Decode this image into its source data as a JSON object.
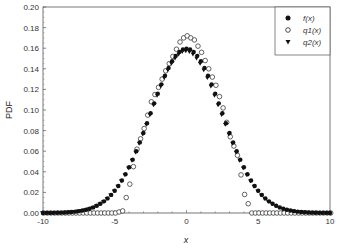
{
  "chart_data": {
    "type": "scatter",
    "title": "",
    "xlabel": "x",
    "ylabel": "PDF",
    "xlim": [
      -10,
      10
    ],
    "ylim": [
      0,
      0.2
    ],
    "xticks": [
      "-10",
      "-5",
      "0",
      "5",
      "10"
    ],
    "yticks": [
      "0.00",
      "0.02",
      "0.04",
      "0.06",
      "0.08",
      "0.10",
      "0.12",
      "0.14",
      "0.16",
      "0.18",
      "0.20"
    ],
    "grid": false,
    "legend_position": "upper right",
    "legend": [
      {
        "label": "f(x)",
        "marker": "filled-circle"
      },
      {
        "label": "q1(x)",
        "marker": "open-circle"
      },
      {
        "label": "q2(x)",
        "marker": "filled-triangle-down"
      }
    ],
    "series": [
      {
        "name": "f(x)",
        "description": "Gaussian-shaped PDF, mean 0, peak ~0.159, sigma ~2.5",
        "x": [
          -10,
          -9.5,
          -9,
          -8.5,
          -8,
          -7.5,
          -7,
          -6.5,
          -6,
          -5.5,
          -5,
          -4.5,
          -4,
          -3.5,
          -3,
          -2.5,
          -2,
          -1.5,
          -1,
          -0.5,
          0,
          0.5,
          1,
          1.5,
          2,
          2.5,
          3,
          3.5,
          4,
          4.5,
          5,
          5.5,
          6,
          6.5,
          7,
          7.5,
          8,
          8.5,
          9,
          9.5,
          10
        ],
        "values": [
          0.0001,
          0.0002,
          0.0004,
          0.0006,
          0.0009,
          0.0018,
          0.0032,
          0.0054,
          0.0089,
          0.0141,
          0.0216,
          0.0316,
          0.0444,
          0.0599,
          0.0777,
          0.0968,
          0.1158,
          0.1332,
          0.1473,
          0.1563,
          0.1596,
          0.1563,
          0.1473,
          0.1332,
          0.1158,
          0.0968,
          0.0777,
          0.0599,
          0.0444,
          0.0316,
          0.0216,
          0.0141,
          0.0089,
          0.0054,
          0.0032,
          0.0018,
          0.0009,
          0.0006,
          0.0004,
          0.0002,
          0.0001
        ]
      },
      {
        "name": "q1(x)",
        "description": "Noisy approximation, zero for |x| > ~4.5, peak ~0.172",
        "x": [
          -10,
          -9.5,
          -9,
          -8.5,
          -8,
          -7.5,
          -7,
          -6.5,
          -6,
          -5.5,
          -5,
          -4.5,
          -4,
          -3.5,
          -3,
          -2.5,
          -2,
          -1.5,
          -1,
          -0.5,
          -0.25,
          0,
          0.25,
          0.5,
          1,
          1.5,
          2,
          2.5,
          3,
          3.5,
          4,
          4.5,
          5,
          5.5,
          6,
          6.5,
          7,
          7.5,
          8,
          8.5,
          9,
          9.5,
          10
        ],
        "values": [
          0,
          0,
          0,
          0,
          0,
          0,
          0,
          0,
          0,
          0,
          0,
          0.002,
          0.028,
          0.062,
          0.082,
          0.108,
          0.122,
          0.138,
          0.152,
          0.166,
          0.17,
          0.172,
          0.17,
          0.168,
          0.156,
          0.14,
          0.124,
          0.102,
          0.074,
          0.056,
          0.018,
          0,
          0,
          0,
          0,
          0,
          0,
          0,
          0,
          0,
          0,
          0,
          0
        ]
      },
      {
        "name": "q2(x)",
        "description": "Closely matches f(x)",
        "x": [
          -10,
          -9.5,
          -9,
          -8.5,
          -8,
          -7.5,
          -7,
          -6.5,
          -6,
          -5.5,
          -5,
          -4.5,
          -4,
          -3.5,
          -3,
          -2.5,
          -2,
          -1.5,
          -1,
          -0.5,
          0,
          0.5,
          1,
          1.5,
          2,
          2.5,
          3,
          3.5,
          4,
          4.5,
          5,
          5.5,
          6,
          6.5,
          7,
          7.5,
          8,
          8.5,
          9,
          9.5,
          10
        ],
        "values": [
          0.0001,
          0.0002,
          0.0004,
          0.0006,
          0.0009,
          0.0018,
          0.0032,
          0.0054,
          0.0089,
          0.0141,
          0.0216,
          0.0316,
          0.0444,
          0.0599,
          0.0777,
          0.0968,
          0.1158,
          0.1332,
          0.1473,
          0.1563,
          0.1596,
          0.1563,
          0.1473,
          0.1332,
          0.1158,
          0.0968,
          0.0777,
          0.0599,
          0.0444,
          0.0316,
          0.0216,
          0.0141,
          0.0089,
          0.0054,
          0.0032,
          0.0018,
          0.0009,
          0.0006,
          0.0004,
          0.0002,
          0.0001
        ]
      }
    ]
  }
}
